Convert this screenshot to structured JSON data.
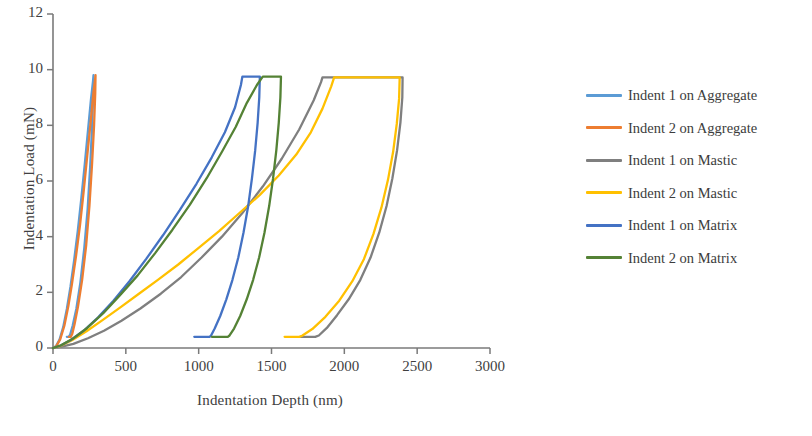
{
  "chart_data": {
    "type": "line",
    "title": "",
    "xlabel": "Indentation Depth (nm)",
    "ylabel": "Indentation Load (mN)",
    "xlim": [
      0,
      3000
    ],
    "ylim": [
      0,
      12
    ],
    "xticks": [
      "0",
      "500",
      "1000",
      "1500",
      "2000",
      "2500",
      "3000"
    ],
    "yticks": [
      "0",
      "2",
      "4",
      "6",
      "8",
      "10",
      "12"
    ],
    "grid": false,
    "legend_position": "right",
    "colors": {
      "indent1_aggregate": "#5B9BD5",
      "indent2_aggregate": "#ED7D31",
      "indent1_mastic": "#7F7F7F",
      "indent2_mastic": "#FFC000",
      "indent1_matrix": "#4472C4",
      "indent2_matrix": "#548235"
    },
    "series": [
      {
        "name": "Indent 1 on Aggregate",
        "color": "#5B9BD5",
        "peak_load": 9.8,
        "peak_depth": 278,
        "residual_depth": 105,
        "points": [
          [
            0,
            0
          ],
          [
            20,
            0.06
          ],
          [
            45,
            0.3
          ],
          [
            70,
            0.75
          ],
          [
            95,
            1.4
          ],
          [
            120,
            2.2
          ],
          [
            145,
            3.15
          ],
          [
            170,
            4.2
          ],
          [
            195,
            5.4
          ],
          [
            218,
            6.6
          ],
          [
            240,
            7.8
          ],
          [
            260,
            8.9
          ],
          [
            275,
            9.6
          ],
          [
            278,
            9.8
          ],
          [
            276,
            9.1
          ],
          [
            268,
            7.9
          ],
          [
            255,
            6.5
          ],
          [
            238,
            5.0
          ],
          [
            215,
            3.6
          ],
          [
            188,
            2.35
          ],
          [
            160,
            1.4
          ],
          [
            135,
            0.8
          ],
          [
            118,
            0.48
          ],
          [
            108,
            0.4
          ],
          [
            95,
            0.4
          ]
        ]
      },
      {
        "name": "Indent 2 on Aggregate",
        "color": "#ED7D31",
        "peak_load": 9.8,
        "peak_depth": 292,
        "residual_depth": 125,
        "points": [
          [
            0,
            0
          ],
          [
            22,
            0.06
          ],
          [
            50,
            0.32
          ],
          [
            78,
            0.8
          ],
          [
            105,
            1.5
          ],
          [
            130,
            2.3
          ],
          [
            158,
            3.3
          ],
          [
            185,
            4.4
          ],
          [
            210,
            5.6
          ],
          [
            235,
            6.9
          ],
          [
            258,
            8.1
          ],
          [
            278,
            9.2
          ],
          [
            290,
            9.7
          ],
          [
            292,
            9.8
          ],
          [
            290,
            9.15
          ],
          [
            282,
            8.0
          ],
          [
            268,
            6.6
          ],
          [
            250,
            5.1
          ],
          [
            228,
            3.7
          ],
          [
            200,
            2.45
          ],
          [
            172,
            1.5
          ],
          [
            148,
            0.85
          ],
          [
            132,
            0.5
          ],
          [
            122,
            0.4
          ],
          [
            108,
            0.4
          ]
        ]
      },
      {
        "name": "Indent 1 on Mastic",
        "color": "#7F7F7F",
        "peak_load": 9.72,
        "peak_depth": 1850,
        "hold_depth": 2400,
        "residual_depth": 1795,
        "points": [
          [
            0,
            0
          ],
          [
            60,
            0.05
          ],
          [
            140,
            0.15
          ],
          [
            240,
            0.35
          ],
          [
            350,
            0.62
          ],
          [
            470,
            0.98
          ],
          [
            600,
            1.42
          ],
          [
            740,
            1.95
          ],
          [
            880,
            2.55
          ],
          [
            1020,
            3.25
          ],
          [
            1160,
            4.0
          ],
          [
            1300,
            4.85
          ],
          [
            1440,
            5.8
          ],
          [
            1570,
            6.8
          ],
          [
            1690,
            7.85
          ],
          [
            1790,
            8.9
          ],
          [
            1840,
            9.55
          ],
          [
            1850,
            9.72
          ],
          [
            2000,
            9.72
          ],
          [
            2150,
            9.72
          ],
          [
            2300,
            9.72
          ],
          [
            2400,
            9.72
          ],
          [
            2398,
            9.0
          ],
          [
            2385,
            8.1
          ],
          [
            2362,
            7.1
          ],
          [
            2330,
            6.1
          ],
          [
            2290,
            5.1
          ],
          [
            2240,
            4.15
          ],
          [
            2180,
            3.25
          ],
          [
            2110,
            2.45
          ],
          [
            2030,
            1.75
          ],
          [
            1950,
            1.18
          ],
          [
            1880,
            0.72
          ],
          [
            1825,
            0.45
          ],
          [
            1800,
            0.4
          ],
          [
            1700,
            0.4
          ]
        ]
      },
      {
        "name": "Indent 2 on Mastic",
        "color": "#FFC000",
        "peak_load": 9.72,
        "peak_depth": 1930,
        "hold_depth": 2380,
        "residual_depth": 1685,
        "points": [
          [
            0,
            0
          ],
          [
            55,
            0.08
          ],
          [
            130,
            0.28
          ],
          [
            230,
            0.6
          ],
          [
            340,
            1.0
          ],
          [
            460,
            1.45
          ],
          [
            590,
            1.95
          ],
          [
            720,
            2.45
          ],
          [
            860,
            3.0
          ],
          [
            1000,
            3.6
          ],
          [
            1140,
            4.2
          ],
          [
            1280,
            4.85
          ],
          [
            1420,
            5.5
          ],
          [
            1550,
            6.2
          ],
          [
            1670,
            6.95
          ],
          [
            1770,
            7.75
          ],
          [
            1850,
            8.6
          ],
          [
            1910,
            9.4
          ],
          [
            1930,
            9.72
          ],
          [
            2080,
            9.72
          ],
          [
            2220,
            9.72
          ],
          [
            2330,
            9.72
          ],
          [
            2380,
            9.72
          ],
          [
            2376,
            8.95
          ],
          [
            2360,
            8.05
          ],
          [
            2335,
            7.05
          ],
          [
            2300,
            6.05
          ],
          [
            2255,
            5.05
          ],
          [
            2200,
            4.1
          ],
          [
            2135,
            3.2
          ],
          [
            2055,
            2.4
          ],
          [
            1965,
            1.7
          ],
          [
            1870,
            1.12
          ],
          [
            1780,
            0.68
          ],
          [
            1710,
            0.44
          ],
          [
            1690,
            0.4
          ],
          [
            1590,
            0.4
          ]
        ]
      },
      {
        "name": "Indent 1 on Matrix",
        "color": "#4472C4",
        "peak_load": 9.75,
        "peak_depth": 1300,
        "hold_depth": 1420,
        "residual_depth": 1075,
        "points": [
          [
            0,
            0
          ],
          [
            50,
            0.08
          ],
          [
            120,
            0.28
          ],
          [
            210,
            0.62
          ],
          [
            310,
            1.1
          ],
          [
            415,
            1.7
          ],
          [
            525,
            2.4
          ],
          [
            640,
            3.2
          ],
          [
            755,
            4.05
          ],
          [
            870,
            4.95
          ],
          [
            985,
            5.9
          ],
          [
            1090,
            6.85
          ],
          [
            1180,
            7.75
          ],
          [
            1250,
            8.65
          ],
          [
            1290,
            9.45
          ],
          [
            1300,
            9.75
          ],
          [
            1350,
            9.75
          ],
          [
            1400,
            9.75
          ],
          [
            1420,
            9.75
          ],
          [
            1416,
            9.0
          ],
          [
            1405,
            8.1
          ],
          [
            1388,
            7.1
          ],
          [
            1366,
            6.1
          ],
          [
            1340,
            5.1
          ],
          [
            1308,
            4.15
          ],
          [
            1272,
            3.25
          ],
          [
            1232,
            2.45
          ],
          [
            1190,
            1.75
          ],
          [
            1148,
            1.15
          ],
          [
            1110,
            0.7
          ],
          [
            1085,
            0.45
          ],
          [
            1075,
            0.4
          ],
          [
            970,
            0.4
          ]
        ]
      },
      {
        "name": "Indent 2 on Matrix",
        "color": "#548235",
        "peak_load": 9.75,
        "peak_depth": 1440,
        "hold_depth": 1565,
        "residual_depth": 1200,
        "points": [
          [
            0,
            0
          ],
          [
            55,
            0.1
          ],
          [
            135,
            0.33
          ],
          [
            235,
            0.72
          ],
          [
            345,
            1.25
          ],
          [
            460,
            1.9
          ],
          [
            580,
            2.6
          ],
          [
            700,
            3.4
          ],
          [
            820,
            4.25
          ],
          [
            940,
            5.15
          ],
          [
            1055,
            6.1
          ],
          [
            1160,
            7.05
          ],
          [
            1255,
            7.95
          ],
          [
            1330,
            8.8
          ],
          [
            1400,
            9.45
          ],
          [
            1440,
            9.75
          ],
          [
            1490,
            9.75
          ],
          [
            1540,
            9.75
          ],
          [
            1565,
            9.75
          ],
          [
            1561,
            9.0
          ],
          [
            1550,
            8.1
          ],
          [
            1533,
            7.1
          ],
          [
            1511,
            6.1
          ],
          [
            1484,
            5.1
          ],
          [
            1452,
            4.15
          ],
          [
            1415,
            3.25
          ],
          [
            1374,
            2.45
          ],
          [
            1330,
            1.75
          ],
          [
            1285,
            1.15
          ],
          [
            1243,
            0.7
          ],
          [
            1212,
            0.45
          ],
          [
            1200,
            0.4
          ],
          [
            1090,
            0.4
          ]
        ]
      }
    ]
  },
  "legend": {
    "items": [
      {
        "label": "Indent 1 on Aggregate",
        "color": "#5B9BD5"
      },
      {
        "label": "Indent 2 on Aggregate",
        "color": "#ED7D31"
      },
      {
        "label": "Indent 1 on Mastic",
        "color": "#7F7F7F"
      },
      {
        "label": "Indent 2 on Mastic",
        "color": "#FFC000"
      },
      {
        "label": "Indent 1 on Matrix",
        "color": "#4472C4"
      },
      {
        "label": "Indent 2 on Matrix",
        "color": "#548235"
      }
    ]
  }
}
